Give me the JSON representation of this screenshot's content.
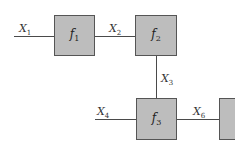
{
  "diagram": {
    "type": "block-diagram",
    "blocks": [
      {
        "id": "f1",
        "name": "f",
        "sub": "1"
      },
      {
        "id": "f2",
        "name": "f",
        "sub": "2"
      },
      {
        "id": "f3",
        "name": "f",
        "sub": "3"
      },
      {
        "id": "partial",
        "name": "",
        "sub": ""
      }
    ],
    "signals": [
      {
        "id": "X1",
        "name": "X",
        "sub": "1",
        "from": "input",
        "to": "f1"
      },
      {
        "id": "X2",
        "name": "X",
        "sub": "2",
        "from": "f1",
        "to": "f2"
      },
      {
        "id": "X3",
        "name": "X",
        "sub": "3",
        "from": "f2",
        "to": "f3"
      },
      {
        "id": "X4",
        "name": "X",
        "sub": "4",
        "from": "input",
        "to": "f3"
      },
      {
        "id": "X6",
        "name": "X",
        "sub": "6",
        "from": "f3",
        "to": "partial"
      }
    ],
    "colors": {
      "block_fill": "#bdbdbd",
      "block_border": "#555555",
      "line": "#4a4a4a"
    }
  }
}
